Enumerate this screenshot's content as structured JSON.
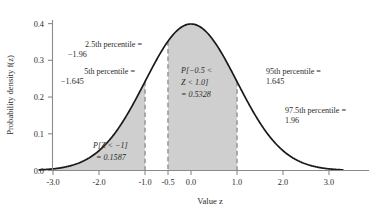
{
  "chart_data": {
    "type": "area",
    "title": "",
    "xlabel": "Value z",
    "ylabel": "Probability density f(z)",
    "xlim": [
      -3.3,
      3.3
    ],
    "ylim": [
      0.0,
      0.44
    ],
    "grid": false,
    "legend": "none",
    "distribution": "standard normal (mean 0, sd 1)",
    "x_ticks": [
      "-3.0",
      "-2.0",
      "-1.0",
      "-0.5",
      "0.0",
      "1.0",
      "2.0",
      "3.0"
    ],
    "x_tick_values": [
      -3.0,
      -2.0,
      -1.0,
      -0.5,
      0.0,
      1.0,
      2.0,
      3.0
    ],
    "y_ticks": [
      "0.0",
      "0.1",
      "0.2",
      "0.3",
      "0.4"
    ],
    "y_tick_values": [
      0.0,
      0.1,
      0.2,
      0.3,
      0.4
    ],
    "series": [
      {
        "name": "standard normal density",
        "x": [
          -3.0,
          -2.5,
          -2.0,
          -1.645,
          -1.5,
          -1.0,
          -0.5,
          0.0,
          0.5,
          1.0,
          1.5,
          1.645,
          2.0,
          2.5,
          3.0
        ],
        "values": [
          0.0044,
          0.0175,
          0.054,
          0.1031,
          0.1295,
          0.242,
          0.3521,
          0.3989,
          0.3521,
          0.242,
          0.1295,
          0.1031,
          0.054,
          0.0175,
          0.0044
        ]
      }
    ],
    "shaded_regions": [
      {
        "name": "left-tail",
        "from": -3.3,
        "to": -1.0,
        "probability": 0.1587
      },
      {
        "name": "central-band",
        "from": -0.5,
        "to": 1.0,
        "probability": 0.5328
      }
    ],
    "reference_lines": [
      {
        "name": "z-minus-1",
        "z": -1.0,
        "style": "dashed"
      },
      {
        "name": "z-minus-0-5",
        "z": -0.5,
        "style": "dashed"
      },
      {
        "name": "z-plus-1",
        "z": 1.0,
        "style": "dashed"
      }
    ]
  },
  "annotations": {
    "pct_2_5": {
      "line1": "2.5th percentile =",
      "line2": "−1.96"
    },
    "pct_5": {
      "line1": "5th percentile =",
      "line2": "−1.645"
    },
    "pct_95": {
      "line1": "95th percentile =",
      "line2": "1.645"
    },
    "pct_97_5": {
      "line1": "97.5th percentile =",
      "line2": "1.96"
    },
    "central_prob": {
      "line1": "P[−0.5 <",
      "line2": "Z < 1.0]",
      "line3": "= 0.5328"
    },
    "left_tail_prob": {
      "line1": "P[Z < −1]",
      "line2": "= 0.1587"
    }
  },
  "colors": {
    "curve": "#1a1a1a",
    "shade": "#cfcfcf",
    "axis": "#8a8a8a",
    "dashed": "#9a9a9a",
    "text": "#2b2b2b",
    "background": "#ffffff"
  }
}
